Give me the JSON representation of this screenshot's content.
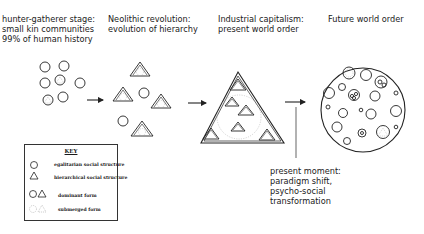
{
  "stages": [
    {
      "id": "hunter-gatherer",
      "text": "hunter-gatherer stage:\nsmall kin communities\n99% of human history"
    },
    {
      "id": "neolithic",
      "text": "Neolithic revolution:\nevolution of hierarchy"
    },
    {
      "id": "industrial",
      "text": "Industrial capitalism:\npresent world order"
    },
    {
      "id": "future",
      "text": "Future world order"
    }
  ],
  "annotation": {
    "text": "present moment:\nparadigm shift,\npsycho-social\ntransformation"
  },
  "key": {
    "title": "KEY",
    "items": [
      {
        "icon": "circle-icon",
        "label": "egalitarian social structure"
      },
      {
        "icon": "triangle-icon",
        "label": "hierarchical social structure"
      },
      {
        "icon": "circle-triangle-icon",
        "label": "dominant form"
      },
      {
        "icon": "dashed-shapes-icon",
        "label": "submerged form"
      }
    ]
  },
  "colors": {
    "stroke": "#222222",
    "dashed": "#999999",
    "background": "#ffffff"
  }
}
